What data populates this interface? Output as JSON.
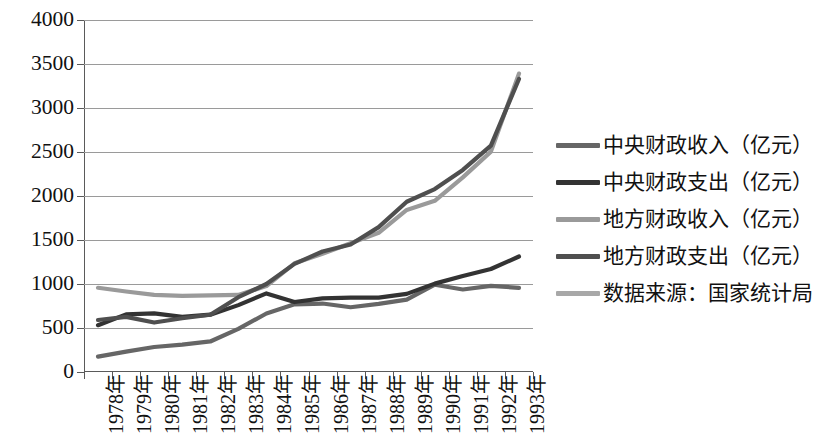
{
  "chart_data": {
    "type": "line",
    "title": "",
    "xlabel": "",
    "ylabel": "",
    "ylim": [
      0,
      4000
    ],
    "ytick_step": 500,
    "yticks": [
      "0",
      "500",
      "1000",
      "1500",
      "2000",
      "2500",
      "3000",
      "3500",
      "4000"
    ],
    "grid": true,
    "legend_position": "right",
    "categories": [
      "1978年",
      "1979年",
      "1980年",
      "1981年",
      "1982年",
      "1983年",
      "1984年",
      "1985年",
      "1986年",
      "1987年",
      "1988年",
      "1989年",
      "1990年",
      "1991年",
      "1992年",
      "1993年"
    ],
    "series": [
      {
        "name": "中央财政收入（亿元）",
        "color": "#666666",
        "values": [
          175,
          231,
          284,
          311,
          347,
          490,
          665,
          769,
          778,
          736,
          775,
          823,
          992,
          938,
          979,
          957
        ]
      },
      {
        "name": "中央财政支出（亿元）",
        "color": "#333333",
        "values": [
          532,
          655,
          667,
          626,
          651,
          760,
          893,
          795,
          836,
          845,
          845,
          888,
          1004,
          1091,
          1170,
          1312
        ]
      },
      {
        "name": "地方财政收入（亿元）",
        "color": "#9a9a9a",
        "values": [
          957,
          915,
          876,
          866,
          870,
          876,
          977,
          1235,
          1344,
          1463,
          1582,
          1842,
          1945,
          2212,
          2504,
          3391
        ]
      },
      {
        "name": "地方财政支出（亿元）",
        "color": "#4f4f4f",
        "values": [
          591,
          627,
          562,
          611,
          651,
          850,
          1000,
          1229,
          1369,
          1449,
          1646,
          1935,
          2079,
          2296,
          2572,
          3330
        ]
      }
    ],
    "source_note": "数据来源：国家统计局",
    "source_note_color": "#a8a8a8"
  },
  "legend": {
    "entries": [
      {
        "label": "中央财政收入（亿元）",
        "color": "#666666"
      },
      {
        "label": "中央财政支出（亿元）",
        "color": "#333333"
      },
      {
        "label": "地方财政收入（亿元）",
        "color": "#9a9a9a"
      },
      {
        "label": "地方财政支出（亿元）",
        "color": "#4f4f4f"
      },
      {
        "label": "数据来源：国家统计局",
        "color": "#a8a8a8"
      }
    ]
  },
  "axis": {
    "y_labels": [
      "4000",
      "3500",
      "3000",
      "2500",
      "2000",
      "1500",
      "1000",
      "500",
      "0"
    ],
    "x_labels": [
      "1978年",
      "1979年",
      "1980年",
      "1981年",
      "1982年",
      "1983年",
      "1984年",
      "1985年",
      "1986年",
      "1987年",
      "1988年",
      "1989年",
      "1990年",
      "1991年",
      "1992年",
      "1993年"
    ]
  }
}
